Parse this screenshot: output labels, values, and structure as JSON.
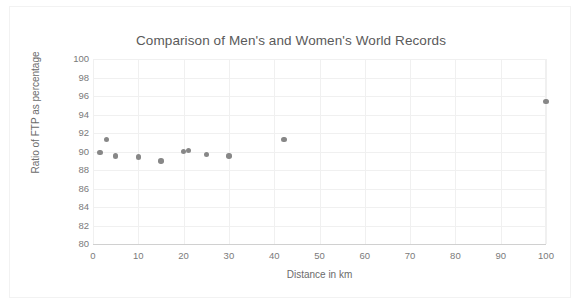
{
  "chart_data": {
    "type": "scatter",
    "title": "Comparison of Men's and Women's World Records",
    "xlabel": "Distance in km",
    "ylabel": "Ratio of  FTP as percentage",
    "xlim": [
      0,
      100
    ],
    "ylim": [
      80,
      100
    ],
    "xticks": [
      0,
      10,
      20,
      30,
      40,
      50,
      60,
      70,
      80,
      90,
      100
    ],
    "yticks": [
      80,
      82,
      84,
      86,
      88,
      90,
      92,
      94,
      96,
      98,
      100
    ],
    "grid": true,
    "legend": "none",
    "marker_color": "#878787",
    "series": [
      {
        "name": "Ratio of FTP as percentage",
        "points": [
          {
            "x": 1.5,
            "y": 89.9
          },
          {
            "x": 3.0,
            "y": 91.3
          },
          {
            "x": 5.0,
            "y": 89.5
          },
          {
            "x": 10.0,
            "y": 89.4
          },
          {
            "x": 15.0,
            "y": 89.0
          },
          {
            "x": 20.0,
            "y": 90.0
          },
          {
            "x": 21.1,
            "y": 90.1
          },
          {
            "x": 25.0,
            "y": 89.7
          },
          {
            "x": 30.0,
            "y": 89.5
          },
          {
            "x": 42.2,
            "y": 91.3
          },
          {
            "x": 100.0,
            "y": 95.4
          }
        ]
      }
    ]
  },
  "colors": {
    "marker": "#878787",
    "gridline": "#f0f0f0",
    "axis": "#d0d0d0",
    "title_text": "#5a5a5a",
    "tick_text": "#7a7a7a",
    "frame_border": "#f2f2f2"
  }
}
